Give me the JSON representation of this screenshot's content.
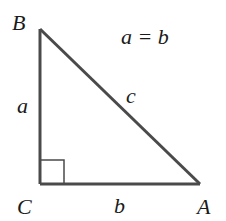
{
  "diagram": {
    "type": "right-triangle",
    "stroke_color": "#4a4a4a",
    "vertices": {
      "B": {
        "label": "B",
        "x": 40,
        "y": 29
      },
      "C": {
        "label": "C",
        "x": 40,
        "y": 184
      },
      "A": {
        "label": "A",
        "x": 200,
        "y": 184
      }
    },
    "sides": {
      "a": {
        "label": "a",
        "from": "B",
        "to": "C"
      },
      "b": {
        "label": "b",
        "from": "C",
        "to": "A"
      },
      "c": {
        "label": "c",
        "from": "B",
        "to": "A"
      }
    },
    "right_angle_at": "C",
    "annotation": "a = b"
  }
}
